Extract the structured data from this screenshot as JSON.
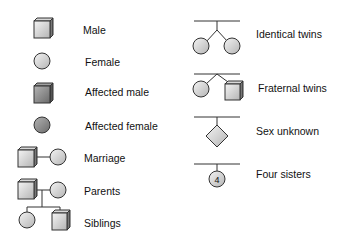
{
  "legend": {
    "left": [
      {
        "symbol": "square-unaffected",
        "label": "Male"
      },
      {
        "symbol": "circle-unaffected",
        "label": "Female"
      },
      {
        "symbol": "square-affected",
        "label": "Affected male"
      },
      {
        "symbol": "circle-affected",
        "label": "Affected female"
      },
      {
        "symbol": "marriage-line",
        "label": "Marriage"
      },
      {
        "symbol": "parents-line",
        "label": "Parents"
      },
      {
        "symbol": "siblings-line",
        "label": "Siblings"
      }
    ],
    "right": [
      {
        "symbol": "identical-twins",
        "label": "Identical twins"
      },
      {
        "symbol": "fraternal-twins",
        "label": "Fraternal twins"
      },
      {
        "symbol": "diamond",
        "label": "Sex unknown"
      },
      {
        "symbol": "numbered-circle",
        "label": "Four sisters",
        "number": "4"
      }
    ]
  },
  "colors": {
    "unaffected_light": "#f2f2f2",
    "unaffected_dark": "#b8b8b8",
    "affected_light": "#b0b0b0",
    "affected_dark": "#6e6e6e",
    "stroke": "#333333"
  }
}
